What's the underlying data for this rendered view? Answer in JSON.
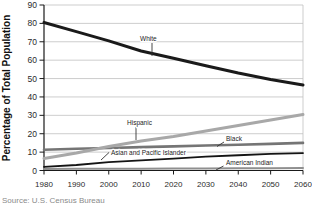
{
  "figure": {
    "source_note": "Source: U.S. Census Bureau"
  },
  "chart_data": {
    "type": "line",
    "title": "",
    "xlabel": "",
    "ylabel": "Percentage of Total Population",
    "x": [
      1980,
      1990,
      2000,
      2010,
      2020,
      2030,
      2040,
      2050,
      2060
    ],
    "ylim": [
      0,
      90
    ],
    "ytick_step": 10,
    "grid": true,
    "legend": "inline-labels",
    "axis_color": "#1a1a1a",
    "grid_color": "#c0c0c0",
    "tick_label_color": "#2b2b2b",
    "series": [
      {
        "name": "White",
        "values": [
          80.5,
          75.5,
          70.5,
          65,
          61,
          57,
          53,
          49.5,
          46.5
        ],
        "color": "#1a1a1a",
        "width": 3,
        "label": {
          "x": 140,
          "y": 41,
          "leader": [
            152,
            43,
            152,
            56
          ]
        }
      },
      {
        "name": "Hispanic",
        "values": [
          6.5,
          9.5,
          13,
          16,
          18.5,
          21.5,
          24.5,
          27.5,
          30.5
        ],
        "color": "#a8a8a8",
        "width": 3,
        "label": {
          "x": 127,
          "y": 125,
          "leader": [
            136,
            127,
            136,
            140
          ]
        }
      },
      {
        "name": "Black",
        "values": [
          11.3,
          11.8,
          12.2,
          12.7,
          13.1,
          13.6,
          14,
          14.5,
          15
        ],
        "color": "#757575",
        "width": 2.6,
        "label": {
          "x": 226,
          "y": 141,
          "leader": [
            224,
            142,
            217,
            146.5
          ]
        }
      },
      {
        "name": "Asian and Pacific Islander",
        "values": [
          2,
          3,
          4.5,
          5.5,
          6.5,
          7.5,
          8.3,
          9,
          9.5
        ],
        "color": "#141414",
        "width": 1.8,
        "label": {
          "x": 111,
          "y": 155,
          "leader": [
            109,
            152.5,
            101,
            160
          ]
        }
      },
      {
        "name": "American Indian",
        "values": [
          0.8,
          0.9,
          1,
          1,
          1.1,
          1.1,
          1.2,
          1.2,
          1.3
        ],
        "color": "#8f8f8f",
        "width": 2,
        "label": {
          "x": 226,
          "y": 165,
          "leader": [
            223.5,
            166,
            216,
            170
          ]
        }
      }
    ]
  }
}
